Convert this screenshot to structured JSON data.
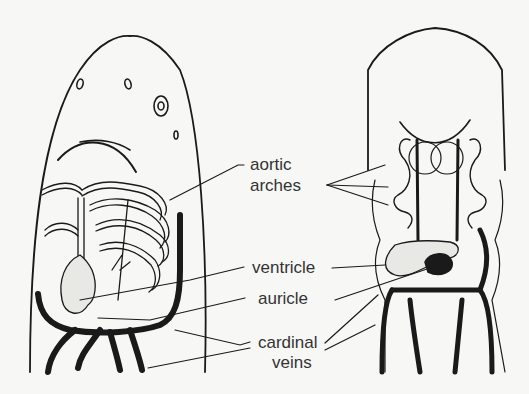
{
  "diagram": {
    "labels": {
      "aortic_line1": "aortic",
      "aortic_line2": "arches",
      "ventricle": "ventricle",
      "auricle": "auricle",
      "cardinal_line1": "cardinal",
      "cardinal_line2": "veins"
    },
    "colors": {
      "ink": "#1a1a1a",
      "background": "#f7f7f5",
      "text": "#333333"
    }
  }
}
